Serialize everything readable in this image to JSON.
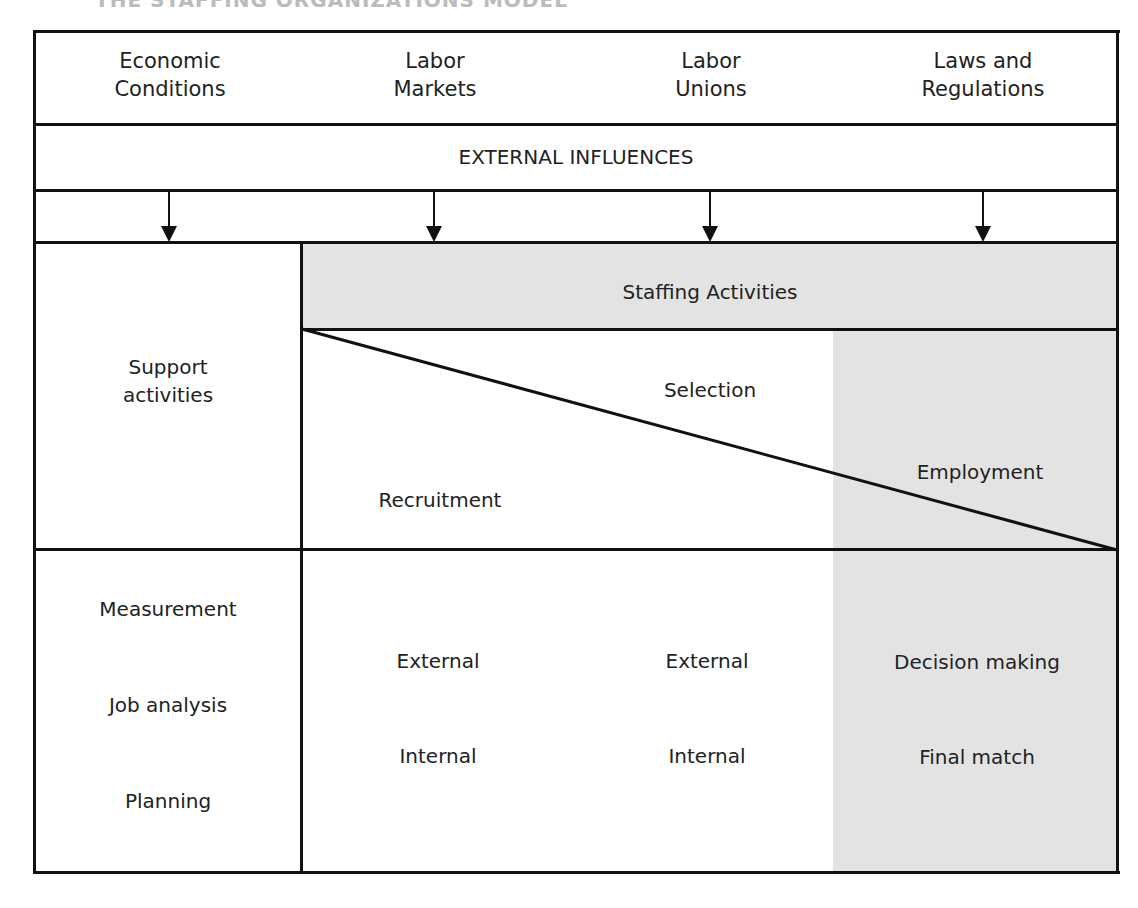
{
  "header_cut_text": "THE STAFFING ORGANIZATIONS MODEL",
  "external": {
    "factors": [
      {
        "line1": "Economic",
        "line2": "Conditions"
      },
      {
        "line1": "Labor",
        "line2": "Markets"
      },
      {
        "line1": "Labor",
        "line2": "Unions"
      },
      {
        "line1": "Laws and",
        "line2": "Regulations"
      }
    ],
    "banner": "EXTERNAL INFLUENCES"
  },
  "support": {
    "title_line1": "Support",
    "title_line2": "activities",
    "items": [
      "Measurement",
      "Job analysis",
      "Planning"
    ]
  },
  "staffing": {
    "title": "Staffing Activities",
    "phases": {
      "recruitment": "Recruitment",
      "selection": "Selection",
      "employment": "Employment"
    },
    "recruitment_items": [
      "External",
      "Internal"
    ],
    "selection_items": [
      "External",
      "Internal"
    ],
    "employment_items": [
      "Decision making",
      "Final match"
    ]
  },
  "colors": {
    "shade": "#e3e3e3",
    "line": "#111111"
  }
}
